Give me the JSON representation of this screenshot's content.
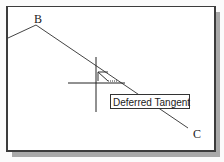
{
  "canvas": {
    "points": [
      {
        "name": "B",
        "x": 36,
        "y": 23
      },
      {
        "name": "C",
        "x": 188,
        "y": 130
      }
    ],
    "cursor": {
      "x": 96,
      "y": 83
    },
    "tooltip": "Deferred Tangent",
    "snap_marker": "deferred-tangent"
  },
  "labels": {
    "B": "B",
    "C": "C"
  }
}
